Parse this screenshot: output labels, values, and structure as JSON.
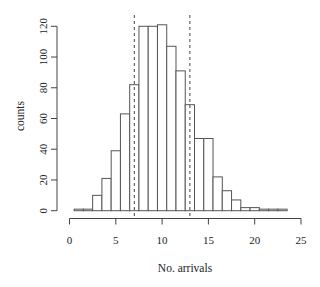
{
  "chart_data": {
    "type": "bar",
    "subtype": "histogram",
    "title": "",
    "xlabel": "No. arrivals",
    "ylabel": "counts",
    "bin_width": 1,
    "bin_centers": [
      1,
      2,
      3,
      4,
      5,
      6,
      7,
      8,
      9,
      10,
      11,
      12,
      13,
      14,
      15,
      16,
      17,
      18,
      19,
      20,
      21,
      22,
      23
    ],
    "values": [
      1,
      1,
      10,
      21,
      39,
      63,
      82,
      120,
      120,
      121,
      107,
      91,
      69,
      47,
      47,
      22,
      13,
      7,
      2,
      2,
      1,
      1,
      1
    ],
    "xlim": [
      0,
      25
    ],
    "ylim": [
      0,
      120
    ],
    "x_ticks": [
      0,
      5,
      10,
      15,
      20,
      25
    ],
    "x_tick_labels": [
      "0",
      "5",
      "10",
      "15",
      "20",
      "25"
    ],
    "y_ticks": [
      0,
      20,
      40,
      60,
      80,
      100,
      120
    ],
    "y_tick_labels": [
      "0",
      "20",
      "40",
      "60",
      "80",
      "100",
      "120"
    ],
    "reference_lines": [
      {
        "x": 7,
        "style": "dashed"
      },
      {
        "x": 13,
        "style": "dashed"
      }
    ],
    "grid": false,
    "legend": null,
    "colors": {
      "bar_fill": "#ffffff",
      "bar_stroke": "#555555",
      "axis": "#444444",
      "text": "#222222"
    }
  }
}
